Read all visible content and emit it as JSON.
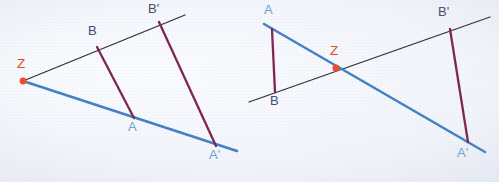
{
  "figure": {
    "caption": "Two geometric constructions of a central projection (central dilation) with centre Z",
    "canvas": {
      "width": 499,
      "height": 182
    },
    "colors": {
      "background": "#f3f5fb",
      "ray_black": "#2b2b33",
      "ray_blue": "#3f7fc4",
      "segment_purple": "#7c2450",
      "center_dot": "#ef4b22",
      "label_z": "#e0472a",
      "label_a": "#6f9fd0",
      "label_b": "#3e4a66"
    },
    "diagrams": [
      {
        "name": "left-diagram",
        "title": "Centre Z outside the figure",
        "center_point": {
          "label": "Z",
          "x": 23,
          "y": 81
        },
        "rays": [
          {
            "name": "ray-through-B",
            "color": "black",
            "from": [
              23,
              81
            ],
            "to": [
              185,
              15
            ]
          },
          {
            "name": "ray-through-A",
            "color": "blue",
            "from": [
              23,
              81
            ],
            "to": [
              237,
              151
            ]
          }
        ],
        "points": [
          {
            "label": "A",
            "x": 134,
            "y": 118,
            "label_x": 129,
            "label_y": 121
          },
          {
            "label": "B",
            "x": 97,
            "y": 47,
            "label_x": 88,
            "label_y": 27
          },
          {
            "label": "A'",
            "x": 216,
            "y": 146,
            "label_x": 210,
            "label_y": 149
          },
          {
            "label": "B'",
            "x": 159,
            "y": 22,
            "label_x": 148,
            "label_y": 2
          }
        ],
        "segments": [
          {
            "name": "segment-BA",
            "from": "B",
            "to": "A",
            "color": "purple"
          },
          {
            "name": "segment-BpAp",
            "from": "B'",
            "to": "A'",
            "color": "purple"
          }
        ]
      },
      {
        "name": "right-diagram",
        "title": "Centre Z between the figure and its image",
        "center_point": {
          "label": "Z",
          "x": 336,
          "y": 68
        },
        "rays": [
          {
            "name": "ray-through-B",
            "color": "black",
            "from": [
              249,
              102
            ],
            "to": [
              490,
              17
            ]
          },
          {
            "name": "ray-through-A",
            "color": "blue",
            "from": [
              264,
              26
            ],
            "to": [
              485,
              152
            ]
          }
        ],
        "points": [
          {
            "label": "A",
            "x": 272,
            "y": 29,
            "label_x": 265,
            "label_y": 4
          },
          {
            "label": "B",
            "x": 275,
            "y": 92,
            "label_x": 271,
            "label_y": 95
          },
          {
            "label": "A'",
            "x": 468,
            "y": 142,
            "label_x": 458,
            "label_y": 147
          },
          {
            "label": "B'",
            "x": 450,
            "y": 29,
            "label_x": 438,
            "label_y": 5
          }
        ],
        "segments": [
          {
            "name": "segment-AB",
            "from": "A",
            "to": "B",
            "color": "purple"
          },
          {
            "name": "segment-BpAp",
            "from": "B'",
            "to": "A'",
            "color": "purple"
          }
        ]
      }
    ],
    "labels": {
      "left": {
        "z": "Z",
        "a": "A",
        "b": "B",
        "a_prime": "A'",
        "b_prime": "B'"
      },
      "right": {
        "z": "Z",
        "a": "A",
        "b": "B",
        "a_prime": "A'",
        "b_prime": "B'"
      }
    }
  }
}
